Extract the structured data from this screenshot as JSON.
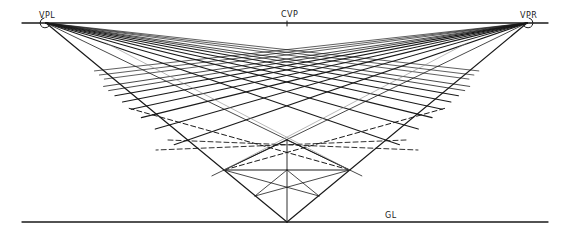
{
  "diagram": {
    "labels": {
      "vpl": "VPL",
      "vpr": "VPR",
      "cvp": "CVP",
      "gl": "GL"
    },
    "colors": {
      "background": "#ffffff",
      "ink": "#1a1a1a",
      "light_ink": "#777777"
    },
    "horizon_line": {
      "x1": 22,
      "y1": 23,
      "x2": 548,
      "y2": 23
    },
    "ground_line": {
      "x1": 22,
      "y1": 222,
      "x2": 548,
      "y2": 222
    },
    "vanishing_points": {
      "vpl": {
        "x": 46,
        "y": 23
      },
      "vpr": {
        "x": 527,
        "y": 23
      },
      "cvp": {
        "x": 287,
        "y": 23
      }
    },
    "station_point_on_gl": {
      "x": 287,
      "y": 222
    },
    "grid": {
      "front_corner": {
        "x": 287,
        "y": 140
      },
      "left_lines_from_vpr_end_x_at_left_edge": [
        120,
        132,
        146,
        160,
        180,
        200
      ],
      "notes": "Lines from VPL fan to the right edge; lines from VPR fan to the left edge; dashed diagonals cross the front squares"
    }
  }
}
